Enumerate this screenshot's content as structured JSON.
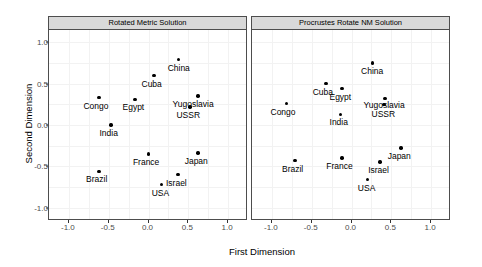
{
  "chart_data": {
    "type": "scatter",
    "title": "",
    "xlabel": "First Dimension",
    "ylabel": "Second Dimension",
    "xlim": [
      -1.25,
      1.25
    ],
    "ylim": [
      -1.15,
      1.15
    ],
    "xticks": [
      -1.0,
      -0.5,
      0.0,
      0.5,
      1.0
    ],
    "xticklabels": [
      "-1.0",
      "-0.5",
      "0.0",
      "0.5",
      "1.0"
    ],
    "yticks": [
      1.0,
      0.5,
      0.0,
      -0.5,
      -1.0
    ],
    "yticklabels": [
      "1.0",
      "0.5",
      "0.0",
      "-0.5",
      "-1.0"
    ],
    "grid": true,
    "legend": "none",
    "facets": [
      {
        "label": "Rotated Metric Solution",
        "points": [
          {
            "label": "China",
            "x": 0.38,
            "y": 0.79,
            "lx": 0.38,
            "ly": 0.68
          },
          {
            "label": "Cuba",
            "x": 0.07,
            "y": 0.6,
            "lx": 0.04,
            "ly": 0.49
          },
          {
            "label": "Congo",
            "x": -0.62,
            "y": 0.33,
            "lx": -0.66,
            "ly": 0.22
          },
          {
            "label": "Egypt",
            "x": -0.17,
            "y": 0.31,
            "lx": -0.19,
            "ly": 0.2
          },
          {
            "label": "Yugoslavia",
            "x": 0.62,
            "y": 0.35,
            "lx": 0.56,
            "ly": 0.24
          },
          {
            "label": "USSR",
            "x": 0.52,
            "y": 0.22,
            "lx": 0.5,
            "ly": 0.11
          },
          {
            "label": "India",
            "x": -0.47,
            "y": 0.0,
            "lx": -0.5,
            "ly": -0.11
          },
          {
            "label": "France",
            "x": 0.0,
            "y": -0.35,
            "lx": -0.03,
            "ly": -0.46
          },
          {
            "label": "Japan",
            "x": 0.62,
            "y": -0.34,
            "lx": 0.6,
            "ly": -0.45
          },
          {
            "label": "Brazil",
            "x": -0.62,
            "y": -0.56,
            "lx": -0.65,
            "ly": -0.67
          },
          {
            "label": "Israel",
            "x": 0.37,
            "y": -0.6,
            "lx": 0.35,
            "ly": -0.71
          },
          {
            "label": "USA",
            "x": 0.16,
            "y": -0.72,
            "lx": 0.15,
            "ly": -0.83
          }
        ]
      },
      {
        "label": "Procrustes Rotate NM Solution",
        "points": [
          {
            "label": "China",
            "x": 0.26,
            "y": 0.75,
            "lx": 0.26,
            "ly": 0.64
          },
          {
            "label": "Cuba",
            "x": -0.32,
            "y": 0.5,
            "lx": -0.36,
            "ly": 0.39
          },
          {
            "label": "Egypt",
            "x": -0.12,
            "y": 0.44,
            "lx": -0.14,
            "ly": 0.33
          },
          {
            "label": "Yugoslavia",
            "x": 0.42,
            "y": 0.32,
            "lx": 0.41,
            "ly": 0.23
          },
          {
            "label": "Congo",
            "x": -0.82,
            "y": 0.26,
            "lx": -0.86,
            "ly": 0.15
          },
          {
            "label": "USSR",
            "x": 0.41,
            "y": 0.25,
            "lx": 0.4,
            "ly": 0.12
          },
          {
            "label": "India",
            "x": -0.14,
            "y": 0.13,
            "lx": -0.16,
            "ly": 0.02
          },
          {
            "label": "Japan",
            "x": 0.62,
            "y": -0.28,
            "lx": 0.6,
            "ly": -0.39
          },
          {
            "label": "France",
            "x": -0.12,
            "y": -0.4,
            "lx": -0.15,
            "ly": -0.51
          },
          {
            "label": "Brazil",
            "x": -0.71,
            "y": -0.43,
            "lx": -0.74,
            "ly": -0.54
          },
          {
            "label": "Israel",
            "x": 0.36,
            "y": -0.45,
            "lx": 0.34,
            "ly": -0.56
          },
          {
            "label": "USA",
            "x": 0.2,
            "y": -0.66,
            "lx": 0.19,
            "ly": -0.77
          }
        ]
      }
    ]
  },
  "style": {
    "strip_fill": "#d9d9d9",
    "panel_border": "#4d4d4d",
    "grid_color": "#f2f2f2",
    "point_color": "#000000",
    "tick_text_color": "#4d4d4d"
  }
}
